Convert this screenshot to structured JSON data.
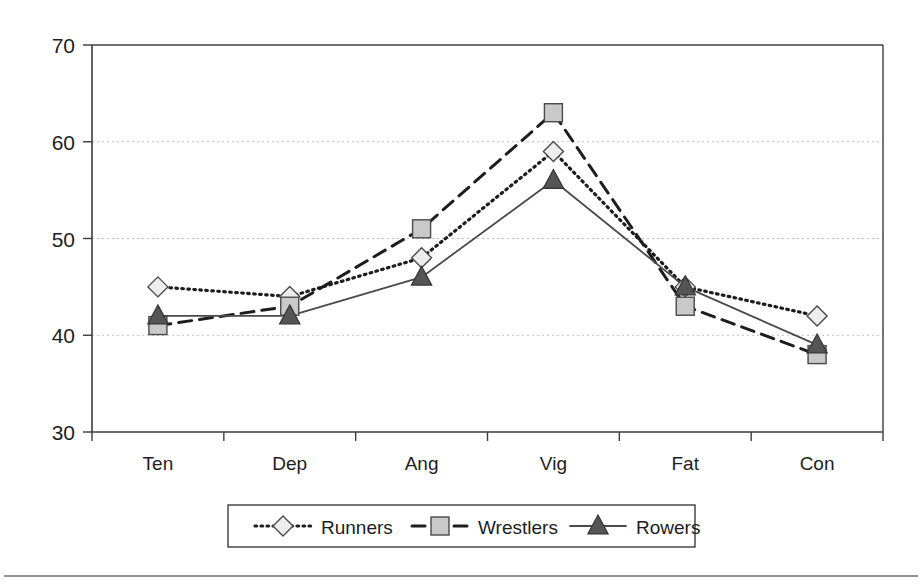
{
  "chart_data": {
    "type": "line",
    "title": "",
    "subtitle": "",
    "xlabel": "",
    "ylabel": "",
    "categories": [
      "Ten",
      "Dep",
      "Ang",
      "Vig",
      "Fat",
      "Con"
    ],
    "ylim": [
      30,
      70
    ],
    "yticks": [
      30,
      40,
      50,
      60,
      70
    ],
    "ytick_labels": [
      "30",
      "40",
      "50",
      "60",
      "70"
    ],
    "grid": "horizontal-dotted",
    "legend_position": "bottom-center",
    "series": [
      {
        "name": "Runners",
        "marker": "diamond",
        "line_style": "dotted",
        "marker_fill": "#ededed",
        "marker_stroke": "#4a4a4a",
        "line_color": "#1d1d1d",
        "values": [
          45,
          44,
          48,
          59,
          45,
          42
        ]
      },
      {
        "name": "Wrestlers",
        "marker": "square",
        "line_style": "dashed",
        "marker_fill": "#c9c9c9",
        "marker_stroke": "#4a4a4a",
        "line_color": "#1d1d1d",
        "values": [
          41,
          43,
          51,
          63,
          43,
          38
        ]
      },
      {
        "name": "Rowers",
        "marker": "triangle",
        "line_style": "solid",
        "marker_fill": "#555555",
        "marker_stroke": "#333333",
        "line_color": "#4a4a4a",
        "values": [
          42,
          42,
          46,
          56,
          45,
          39
        ]
      }
    ],
    "legend_entries": [
      {
        "label": "Runners",
        "marker": "diamond",
        "line_style": "dotted"
      },
      {
        "label": "Wrestlers",
        "marker": "square",
        "line_style": "dashed"
      },
      {
        "label": "Rowers",
        "marker": "triangle",
        "line_style": "solid"
      }
    ],
    "colors": {
      "axis": "#3c3c3c",
      "gridline": "#bdbdbd",
      "plot_background": "#ffffff",
      "page_background": "#ffffff",
      "footer_rule": "#6e6e6e"
    }
  }
}
